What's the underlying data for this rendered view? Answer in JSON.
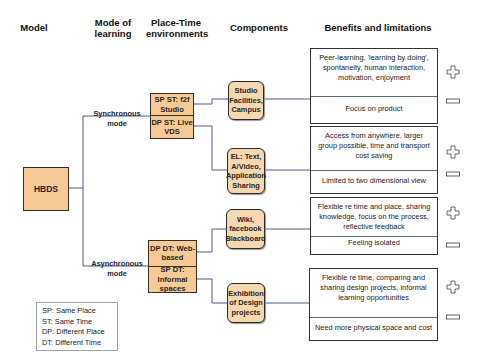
{
  "headers": {
    "model": "Model",
    "mode": "Mode of learning",
    "place_time": "Place-Time environments",
    "components": "Components",
    "benefits": "Benefits and limitations"
  },
  "model": {
    "label": "HBDS"
  },
  "modes": {
    "synchronous": "Synchronous mode",
    "asynchronous": "Asynchronous mode"
  },
  "environments": {
    "sync_top": "SP ST: f2f Studio",
    "sync_bottom": "DP ST: Live VDS",
    "async_top": "DP DT: Web-based",
    "async_bottom": "SP DT: Informal spaces"
  },
  "components": [
    {
      "label": "Studio Facilities, Campus"
    },
    {
      "label": "EL: Text, A/Video, Application Sharing"
    },
    {
      "label": "Wiki, facebook Blackboard"
    },
    {
      "label": "Exhibition of Design projects"
    }
  ],
  "benefits": [
    {
      "benefit": "Peer-learning, 'learning by doing', spontaneity, human interaction, motivation, enjoyment",
      "limitation": "Focus on product"
    },
    {
      "benefit": "Access from anywhere, larger group possible, time and transport cost saving",
      "limitation": "Limited to two dimensional view"
    },
    {
      "benefit": "Flexible re time and place, sharing knowledge, focus on the process, reflective feedback",
      "limitation": "Feeling isolated"
    },
    {
      "benefit": "Flexible re time, comparing and sharing design projects, informal learning opportunities",
      "limitation": "Need more physical space and cost"
    }
  ],
  "signs": {
    "plus": "plus-icon",
    "minus": "minus-icon"
  },
  "legend": [
    "SP: Same Place",
    "ST: Same Time",
    "DP: Different Place",
    "DT: Different Time"
  ],
  "colors": {
    "box_fill": "#f6c995",
    "component_fill": "#f6d8b0",
    "connector": "#4a5d8c"
  }
}
